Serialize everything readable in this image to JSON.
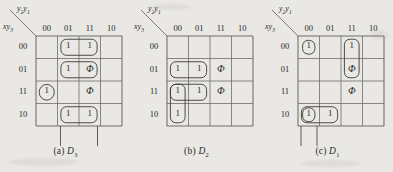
{
  "figure": {
    "background_color": "#e9e8e4",
    "ink_color": "#3a3936",
    "grid_color": "#6e6c66",
    "axis_top_label": "y2y1",
    "axis_side_label": "xy3",
    "column_headers": [
      "00",
      "01",
      "11",
      "10"
    ],
    "row_headers": [
      "00",
      "01",
      "11",
      "10"
    ]
  },
  "maps": [
    {
      "id": "a",
      "caption_prefix": "(a)",
      "caption_var": "D",
      "caption_sub": "3",
      "top_label_main": "y",
      "top_label_sub1": "2",
      "top_label_main2": "y",
      "top_label_sub2": "1",
      "side_label_main": "x",
      "side_label_main2": "y",
      "side_label_sub": "3",
      "columns": [
        "00",
        "01",
        "11",
        "10"
      ],
      "rows": [
        "00",
        "01",
        "11",
        "10"
      ],
      "cells": [
        [
          "",
          "1",
          "1",
          ""
        ],
        [
          "",
          "1",
          "Φ",
          ""
        ],
        [
          "1",
          "",
          "Φ",
          ""
        ],
        [
          "",
          "1",
          "1",
          ""
        ]
      ],
      "groups": [
        {
          "name": "group-row00-col01-col11",
          "shape": "rounded-rect",
          "row": 0,
          "col": 1,
          "rowspan": 1,
          "colspan": 2
        },
        {
          "name": "group-row01-col01-col11",
          "shape": "rounded-rect",
          "row": 1,
          "col": 1,
          "rowspan": 1,
          "colspan": 2
        },
        {
          "name": "group-row11-col00",
          "shape": "circle",
          "row": 2,
          "col": 0,
          "rowspan": 1,
          "colspan": 1
        },
        {
          "name": "group-row10-col01-col11",
          "shape": "rounded-rect",
          "row": 3,
          "col": 1,
          "rowspan": 1,
          "colspan": 2
        }
      ],
      "extension_lines": [
        {
          "name": "ext-line-col01-left"
        },
        {
          "name": "ext-line-col11-right"
        }
      ]
    },
    {
      "id": "b",
      "caption_prefix": "(b)",
      "caption_var": "D",
      "caption_sub": "2",
      "columns": [
        "00",
        "01",
        "11",
        "10"
      ],
      "rows": [
        "00",
        "01",
        "11",
        "10"
      ],
      "cells": [
        [
          "",
          "",
          "",
          ""
        ],
        [
          "1",
          "1",
          "Φ",
          ""
        ],
        [
          "1",
          "1",
          "Φ",
          ""
        ],
        [
          "1",
          "",
          "",
          ""
        ]
      ],
      "groups": [
        {
          "name": "group-row01-col00-col01",
          "shape": "rounded-rect",
          "row": 1,
          "col": 0,
          "rowspan": 1,
          "colspan": 2
        },
        {
          "name": "group-row11-col00-col01",
          "shape": "rounded-rect",
          "row": 2,
          "col": 0,
          "rowspan": 1,
          "colspan": 2
        },
        {
          "name": "group-col00-row11-row10",
          "shape": "rounded-rect",
          "row": 2,
          "col": 0,
          "rowspan": 2,
          "colspan": 1
        }
      ],
      "extension_lines": []
    },
    {
      "id": "c",
      "caption_prefix": "(c)",
      "caption_var": "D",
      "caption_sub": "1",
      "columns": [
        "00",
        "01",
        "11",
        "10"
      ],
      "rows": [
        "00",
        "01",
        "11",
        "10"
      ],
      "cells": [
        [
          "1",
          "",
          "1",
          ""
        ],
        [
          "",
          "",
          "Φ",
          ""
        ],
        [
          "",
          "",
          "Φ",
          ""
        ],
        [
          "1",
          "1",
          "",
          ""
        ]
      ],
      "groups": [
        {
          "name": "group-row00-col00",
          "shape": "rounded-rect",
          "row": 0,
          "col": 0,
          "rowspan": 1,
          "colspan": 1
        },
        {
          "name": "group-col11-row00-row01",
          "shape": "rounded-rect",
          "row": 0,
          "col": 2,
          "rowspan": 2,
          "colspan": 1
        },
        {
          "name": "group-row10-col00-col01",
          "shape": "rounded-rect",
          "row": 3,
          "col": 0,
          "rowspan": 1,
          "colspan": 2
        },
        {
          "name": "group-row10-col00",
          "shape": "rounded-rect",
          "row": 3,
          "col": 0,
          "rowspan": 1,
          "colspan": 1
        }
      ],
      "extension_lines": [
        {
          "name": "ext-line-col00-left"
        },
        {
          "name": "ext-line-col00-right"
        }
      ]
    }
  ]
}
